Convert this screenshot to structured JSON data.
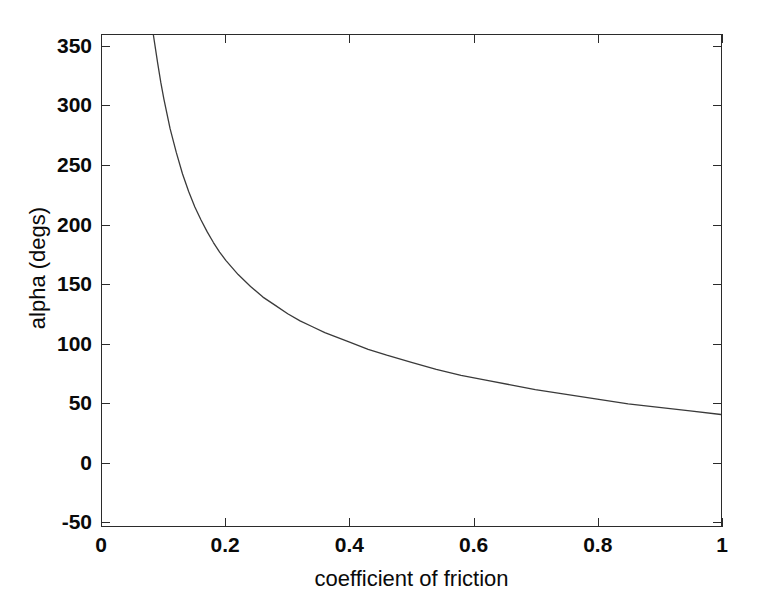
{
  "chart_data": {
    "type": "line",
    "title": "",
    "subtitle": "",
    "xlabel": "coefficient of friction",
    "ylabel": "alpha (degs)",
    "xlim": [
      0,
      1
    ],
    "ylim": [
      -54,
      360
    ],
    "grid": false,
    "legend": null,
    "xticks": [
      "0",
      "0.2",
      "0.4",
      "0.6",
      "0.8",
      "1"
    ],
    "xtick_values": [
      0,
      0.2,
      0.4,
      0.6,
      0.8,
      1
    ],
    "yticks": [
      "-50",
      "0",
      "50",
      "100",
      "150",
      "200",
      "250",
      "300",
      "350"
    ],
    "ytick_values": [
      -50,
      0,
      50,
      100,
      150,
      200,
      250,
      300,
      350
    ],
    "line_color": "#3a3a3a",
    "series": [
      {
        "name": "alpha",
        "x": [
          0.083,
          0.09,
          0.095,
          0.1,
          0.11,
          0.12,
          0.13,
          0.14,
          0.15,
          0.16,
          0.17,
          0.18,
          0.19,
          0.2,
          0.22,
          0.24,
          0.26,
          0.28,
          0.3,
          0.32,
          0.34,
          0.36,
          0.38,
          0.4,
          0.43,
          0.46,
          0.5,
          0.54,
          0.58,
          0.62,
          0.66,
          0.7,
          0.75,
          0.8,
          0.85,
          0.9,
          0.95,
          1.0
        ],
        "y": [
          360,
          336,
          320,
          306,
          281,
          261,
          243,
          228,
          215,
          204,
          194,
          185,
          177,
          170,
          158,
          148,
          139,
          132,
          125,
          119,
          114,
          109,
          105,
          101,
          95,
          90,
          84,
          78,
          73,
          69,
          65,
          61,
          57,
          53,
          49,
          46,
          43,
          40
        ]
      }
    ],
    "annotations": []
  },
  "axes": {
    "x_title": "coefficient of friction",
    "y_title": "alpha (degs)"
  },
  "ticks": {
    "x": [
      {
        "label": "0",
        "value": 0
      },
      {
        "label": "0.2",
        "value": 0.2
      },
      {
        "label": "0.4",
        "value": 0.4
      },
      {
        "label": "0.6",
        "value": 0.6
      },
      {
        "label": "0.8",
        "value": 0.8
      },
      {
        "label": "1",
        "value": 1
      }
    ],
    "y": [
      {
        "label": "350",
        "value": 350
      },
      {
        "label": "300",
        "value": 300
      },
      {
        "label": "250",
        "value": 250
      },
      {
        "label": "200",
        "value": 200
      },
      {
        "label": "150",
        "value": 150
      },
      {
        "label": "100",
        "value": 100
      },
      {
        "label": "50",
        "value": 50
      },
      {
        "label": "0",
        "value": 0
      },
      {
        "label": "-50",
        "value": -50
      }
    ]
  },
  "style": {
    "axis_color": "#2b2b2b",
    "curve_color": "#3a3a3a",
    "background": "#ffffff",
    "text_color": "#0a0a0a"
  }
}
